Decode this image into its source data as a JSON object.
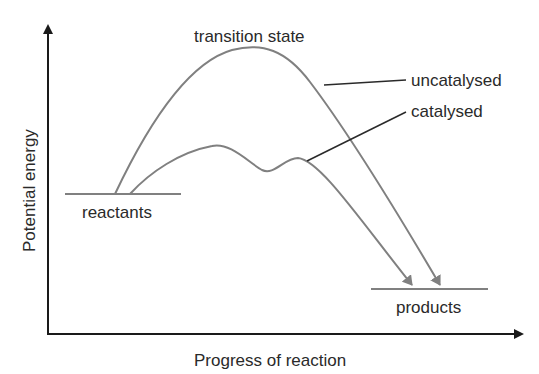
{
  "diagram": {
    "type": "energy-profile",
    "y_axis_label": "Potential energy",
    "x_axis_label": "Progress of reaction",
    "labels": {
      "transition_state": "transition state",
      "uncatalysed": "uncatalysed",
      "catalysed": "catalysed",
      "reactants": "reactants",
      "products": "products"
    },
    "colors": {
      "axis": "#1a1a1a",
      "curve": "#808080",
      "leader": "#2a2a2a",
      "text": "#2a2a2a"
    }
  }
}
